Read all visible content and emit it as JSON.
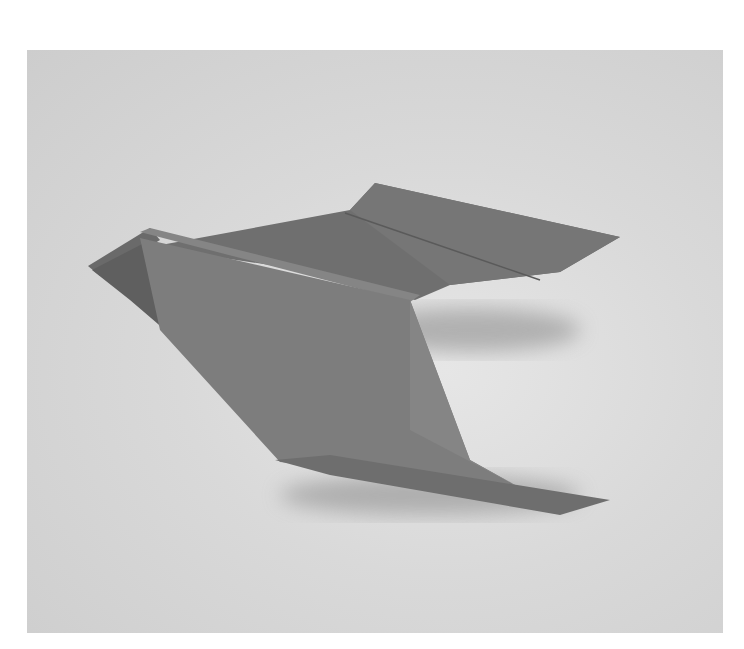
{
  "image": {
    "subject": "origami paper airplane",
    "background_color": "#d8d8d8",
    "paper_color": "#7a7a7a",
    "shadow_color": "#8a8a8a"
  }
}
